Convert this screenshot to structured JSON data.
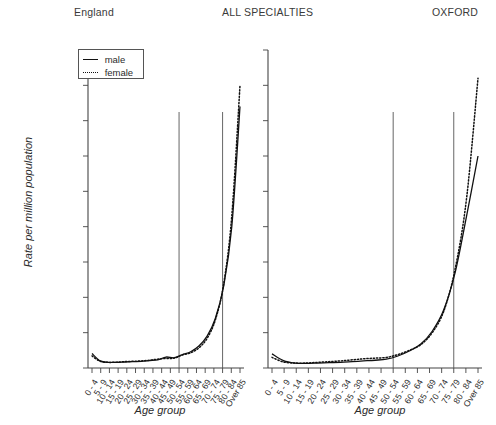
{
  "header": {
    "left": "England",
    "middle": "ALL SPECIALTIES",
    "right": "OXFORD"
  },
  "legend": {
    "male_label": "male",
    "female_label": "female",
    "male_style": "solid",
    "female_style": "dotted",
    "position": "top-left of left panel"
  },
  "axes": {
    "ylabel": "Rate per million population",
    "xlabel_left": "Age group",
    "xlabel_right": "Age group",
    "yticks": [
      "0",
      "5000",
      "10,000",
      "15,000",
      "20,000",
      "25,000",
      "30,000",
      "35,000",
      "40,000",
      "45,000"
    ],
    "ytick_values": [
      0,
      5000,
      10000,
      15000,
      20000,
      25000,
      30000,
      35000,
      40000,
      45000
    ],
    "ylim": [
      0,
      45000
    ],
    "grid": "none"
  },
  "chart_data": [
    {
      "type": "line",
      "title": "England",
      "panel": "left",
      "xlabel": "Age group",
      "ylabel": "Rate per million population",
      "ylim": [
        0,
        45000
      ],
      "grid": false,
      "legend_position": "upper left",
      "categories": [
        "0 - 4",
        "5 - 9",
        "10 - 14",
        "15 - 19",
        "20 - 24",
        "25 - 29",
        "30 - 34",
        "35 - 39",
        "40 - 44",
        "45 - 49",
        "50 - 54",
        "55 - 59",
        "60 - 64",
        "65 - 69",
        "70 - 74",
        "75 - 79",
        "80 - 84",
        "Over 85"
      ],
      "series": [
        {
          "name": "male",
          "style": "solid",
          "values": [
            2050,
            1000,
            800,
            800,
            850,
            900,
            950,
            1050,
            1150,
            1550,
            1450,
            1900,
            2300,
            3100,
            4500,
            7000,
            11500,
            20000,
            37000
          ]
        },
        {
          "name": "female",
          "style": "dotted",
          "values": [
            1700,
            950,
            800,
            830,
            900,
            950,
            1000,
            1100,
            1250,
            1350,
            1400,
            1850,
            2150,
            2850,
            4200,
            6800,
            11800,
            21500,
            40000
          ]
        }
      ],
      "reference_lines": [
        {
          "at_category": "50 - 54",
          "orientation": "vertical"
        },
        {
          "at_category": "75 - 79",
          "orientation": "vertical"
        }
      ]
    },
    {
      "type": "line",
      "title": "OXFORD",
      "panel": "right",
      "xlabel": "Age group",
      "ylabel": "Rate per million population",
      "ylim": [
        0,
        45000
      ],
      "grid": false,
      "legend_position": "none",
      "categories": [
        "0 - 4",
        "5 - 9",
        "10 - 14",
        "15 - 19",
        "20 - 24",
        "25 - 29",
        "30 - 34",
        "35 - 39",
        "40 - 44",
        "45 - 49",
        "50 - 54",
        "55 - 59",
        "60 - 64",
        "65 - 69",
        "70 - 74",
        "75 - 79",
        "80 - 84",
        "Over 85"
      ],
      "series": [
        {
          "name": "male",
          "style": "solid",
          "values": [
            2000,
            1050,
            700,
            650,
            700,
            750,
            800,
            900,
            1000,
            1100,
            1250,
            1700,
            2400,
            3400,
            5200,
            8200,
            13500,
            21500,
            30000
          ]
        },
        {
          "name": "female",
          "style": "dotted",
          "values": [
            1500,
            850,
            700,
            700,
            800,
            900,
            1000,
            1150,
            1300,
            1400,
            1500,
            1900,
            2500,
            3300,
            5000,
            8000,
            14000,
            24000,
            41000
          ]
        }
      ],
      "reference_lines": [
        {
          "at_category": "50 - 54",
          "orientation": "vertical"
        },
        {
          "at_category": "75 - 79",
          "orientation": "vertical"
        }
      ]
    }
  ],
  "colors": {
    "line": "#111111",
    "axis": "#444444",
    "reference_line": "#555555",
    "text": "#2b2b2b"
  }
}
